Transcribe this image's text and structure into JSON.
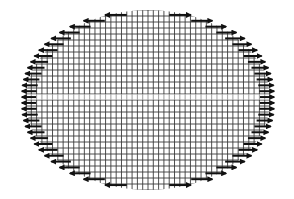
{
  "diagram": {
    "title": "",
    "shape": "ellipse",
    "grid": {
      "columns": 46,
      "rows": 30,
      "line_color": "#3a3a3a"
    },
    "arrows": {
      "direction_rule": "horizontal, pointing away from vertical center axis",
      "rows_per_side": 30,
      "left_direction": "left",
      "right_direction": "right",
      "color": "#111111"
    },
    "colors": {
      "background": "#ffffff",
      "grid": "#3a3a3a",
      "arrow": "#111111"
    }
  }
}
